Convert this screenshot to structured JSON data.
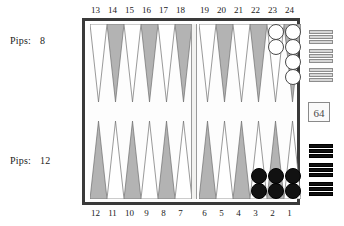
{
  "app": {
    "title": "Backgammon Board"
  },
  "players": {
    "top": {
      "label": "Pips:",
      "pips": "8",
      "color_name": "white",
      "color": "#ffffff"
    },
    "bottom": {
      "label": "Pips:",
      "pips": "12",
      "color_name": "black",
      "color": "#111111"
    }
  },
  "doubling_cube": {
    "value": "64",
    "name": "doubling-cube"
  },
  "board": {
    "border_color": "#3a3a3a",
    "surface_color": "#fdfdfd",
    "point_dark_color": "#b3b3b3",
    "point_light_color": "#ffffff",
    "bar_color": "#f2f2f0",
    "top_numbers": [
      "13",
      "14",
      "15",
      "16",
      "17",
      "18",
      "19",
      "20",
      "21",
      "22",
      "23",
      "24"
    ],
    "bottom_numbers": [
      "12",
      "11",
      "10",
      "9",
      "8",
      "7",
      "6",
      "5",
      "4",
      "3",
      "2",
      "1"
    ],
    "points": [
      {
        "number": "13",
        "row": "top",
        "quadrant": "top-left",
        "slot": 0,
        "shade": "light",
        "checkers": 0,
        "checker_color": ""
      },
      {
        "number": "14",
        "row": "top",
        "quadrant": "top-left",
        "slot": 1,
        "shade": "dark",
        "checkers": 0,
        "checker_color": ""
      },
      {
        "number": "15",
        "row": "top",
        "quadrant": "top-left",
        "slot": 2,
        "shade": "light",
        "checkers": 0,
        "checker_color": ""
      },
      {
        "number": "16",
        "row": "top",
        "quadrant": "top-left",
        "slot": 3,
        "shade": "dark",
        "checkers": 0,
        "checker_color": ""
      },
      {
        "number": "17",
        "row": "top",
        "quadrant": "top-left",
        "slot": 4,
        "shade": "light",
        "checkers": 0,
        "checker_color": ""
      },
      {
        "number": "18",
        "row": "top",
        "quadrant": "top-left",
        "slot": 5,
        "shade": "dark",
        "checkers": 0,
        "checker_color": ""
      },
      {
        "number": "19",
        "row": "top",
        "quadrant": "top-right",
        "slot": 0,
        "shade": "light",
        "checkers": 0,
        "checker_color": ""
      },
      {
        "number": "20",
        "row": "top",
        "quadrant": "top-right",
        "slot": 1,
        "shade": "dark",
        "checkers": 0,
        "checker_color": ""
      },
      {
        "number": "21",
        "row": "top",
        "quadrant": "top-right",
        "slot": 2,
        "shade": "light",
        "checkers": 0,
        "checker_color": ""
      },
      {
        "number": "22",
        "row": "top",
        "quadrant": "top-right",
        "slot": 3,
        "shade": "dark",
        "checkers": 0,
        "checker_color": ""
      },
      {
        "number": "23",
        "row": "top",
        "quadrant": "top-right",
        "slot": 4,
        "shade": "light",
        "checkers": 2,
        "checker_color": "white"
      },
      {
        "number": "24",
        "row": "top",
        "quadrant": "top-right",
        "slot": 5,
        "shade": "dark",
        "checkers": 4,
        "checker_color": "white"
      },
      {
        "number": "12",
        "row": "bottom",
        "quadrant": "bottom-left",
        "slot": 0,
        "shade": "dark",
        "checkers": 0,
        "checker_color": ""
      },
      {
        "number": "11",
        "row": "bottom",
        "quadrant": "bottom-left",
        "slot": 1,
        "shade": "light",
        "checkers": 0,
        "checker_color": ""
      },
      {
        "number": "10",
        "row": "bottom",
        "quadrant": "bottom-left",
        "slot": 2,
        "shade": "dark",
        "checkers": 0,
        "checker_color": ""
      },
      {
        "number": "9",
        "row": "bottom",
        "quadrant": "bottom-left",
        "slot": 3,
        "shade": "light",
        "checkers": 0,
        "checker_color": ""
      },
      {
        "number": "8",
        "row": "bottom",
        "quadrant": "bottom-left",
        "slot": 4,
        "shade": "dark",
        "checkers": 0,
        "checker_color": ""
      },
      {
        "number": "7",
        "row": "bottom",
        "quadrant": "bottom-left",
        "slot": 5,
        "shade": "light",
        "checkers": 0,
        "checker_color": ""
      },
      {
        "number": "6",
        "row": "bottom",
        "quadrant": "bottom-right",
        "slot": 0,
        "shade": "dark",
        "checkers": 0,
        "checker_color": ""
      },
      {
        "number": "5",
        "row": "bottom",
        "quadrant": "bottom-right",
        "slot": 1,
        "shade": "light",
        "checkers": 0,
        "checker_color": ""
      },
      {
        "number": "4",
        "row": "bottom",
        "quadrant": "bottom-right",
        "slot": 2,
        "shade": "dark",
        "checkers": 0,
        "checker_color": ""
      },
      {
        "number": "3",
        "row": "bottom",
        "quadrant": "bottom-right",
        "slot": 3,
        "shade": "light",
        "checkers": 2,
        "checker_color": "black"
      },
      {
        "number": "2",
        "row": "bottom",
        "quadrant": "bottom-right",
        "slot": 4,
        "shade": "dark",
        "checkers": 2,
        "checker_color": "black"
      },
      {
        "number": "1",
        "row": "bottom",
        "quadrant": "bottom-right",
        "slot": 5,
        "shade": "light",
        "checkers": 2,
        "checker_color": "black"
      }
    ]
  },
  "tray": {
    "name": "bear-off-tray",
    "white_groups": [
      3,
      3,
      3
    ],
    "black_groups": [
      3,
      3,
      3
    ]
  }
}
